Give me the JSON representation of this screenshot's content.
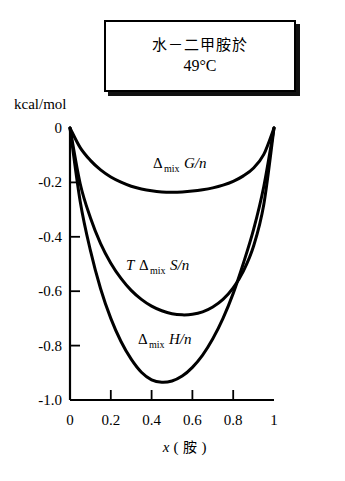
{
  "title_box": {
    "line1": "水－二甲胺於",
    "line2": "49°C"
  },
  "axes": {
    "y_unit": "kcal/mol",
    "x_axis_title_var": "x",
    "x_axis_title_paren_open": "(",
    "x_axis_title_species": "胺",
    "x_axis_title_paren_close": ")",
    "x_ticks": [
      "0",
      "0.2",
      "0.4",
      "0.6",
      "0.8",
      "1"
    ],
    "y_ticks": [
      "0",
      "-0.2",
      "-0.4",
      "-0.6",
      "-0.8",
      "-1.0"
    ]
  },
  "curve_labels": {
    "gibbs_delta": "Δ",
    "gibbs_sub": "mix",
    "gibbs_main": "G/n",
    "entropy_t": "T",
    "entropy_delta": "Δ",
    "entropy_sub": "mix",
    "entropy_main": "S/n",
    "enthalpy_delta": "Δ",
    "enthalpy_sub": "mix",
    "enthalpy_main": "H/n"
  },
  "colors": {
    "curve": "#000000",
    "axis": "#000000",
    "background": "#ffffff",
    "box_shadow": "#111111"
  },
  "chart_data": {
    "type": "line",
    "title": "水－二甲胺於 49°C",
    "xlabel": "x (胺)",
    "ylabel": "kcal/mol",
    "xlim": [
      0,
      1
    ],
    "ylim": [
      -1.0,
      0
    ],
    "grid": false,
    "legend": "inline-labels",
    "x": [
      0,
      0.05,
      0.1,
      0.15,
      0.2,
      0.25,
      0.3,
      0.35,
      0.4,
      0.45,
      0.5,
      0.55,
      0.6,
      0.65,
      0.7,
      0.75,
      0.8,
      0.85,
      0.9,
      0.95,
      1
    ],
    "series": [
      {
        "name": "Δmix G/n",
        "label": "Δ_mix G/n",
        "values": [
          0,
          -0.072,
          -0.119,
          -0.154,
          -0.18,
          -0.199,
          -0.214,
          -0.224,
          -0.231,
          -0.235,
          -0.236,
          -0.235,
          -0.232,
          -0.227,
          -0.22,
          -0.21,
          -0.196,
          -0.176,
          -0.147,
          -0.097,
          0
        ]
      },
      {
        "name": "T Δmix S/n",
        "label": "T Δ_mix S/n",
        "values": [
          0,
          -0.205,
          -0.33,
          -0.425,
          -0.497,
          -0.553,
          -0.597,
          -0.63,
          -0.655,
          -0.672,
          -0.683,
          -0.687,
          -0.685,
          -0.676,
          -0.658,
          -0.63,
          -0.588,
          -0.526,
          -0.434,
          -0.281,
          0
        ]
      },
      {
        "name": "Δmix H/n",
        "label": "Δ_mix H/n",
        "values": [
          0,
          -0.27,
          -0.45,
          -0.591,
          -0.7,
          -0.785,
          -0.85,
          -0.898,
          -0.926,
          -0.935,
          -0.93,
          -0.912,
          -0.88,
          -0.835,
          -0.775,
          -0.7,
          -0.608,
          -0.497,
          -0.373,
          -0.215,
          0
        ]
      }
    ],
    "annotations": [
      {
        "text": "Δ_mix G/n",
        "x": 0.4,
        "y": -0.12
      },
      {
        "text": "T Δ_mix S/n",
        "x": 0.42,
        "y": -0.545
      },
      {
        "text": "Δ_mix H/n",
        "x": 0.45,
        "y": -0.815
      }
    ]
  }
}
